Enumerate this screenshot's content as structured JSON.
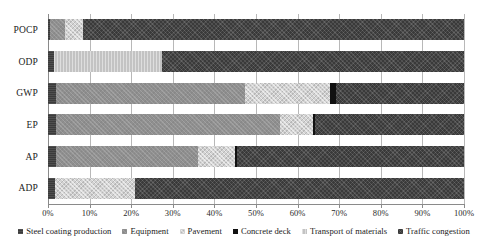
{
  "chart_data": {
    "type": "bar",
    "orientation": "horizontal",
    "stacked": true,
    "normalized": true,
    "title": "",
    "xlabel": "",
    "ylabel": "",
    "xlim": [
      0,
      100
    ],
    "xtick_labels": [
      "0%",
      "10%",
      "20%",
      "30%",
      "40%",
      "50%",
      "60%",
      "70%",
      "80%",
      "90%",
      "100%"
    ],
    "xtick_values": [
      0,
      10,
      20,
      30,
      40,
      50,
      60,
      70,
      80,
      90,
      100
    ],
    "grid": "vertical",
    "legend_position": "bottom",
    "categories": [
      "POCP",
      "ODP",
      "GWP",
      "EP",
      "AP",
      "ADP"
    ],
    "series": [
      {
        "name": "Steel coating production",
        "color": "#3b3b3b",
        "values": [
          0.5,
          1.5,
          2.0,
          2.0,
          2.0,
          1.7
        ]
      },
      {
        "name": "Equipment",
        "color": "#8f8f8f",
        "values": [
          3.6,
          0.0,
          45.4,
          53.8,
          34.0,
          0.0
        ]
      },
      {
        "name": "Pavement",
        "color": "#d2d2d2",
        "values": [
          4.3,
          0.0,
          20.4,
          7.9,
          9.0,
          19.2
        ]
      },
      {
        "name": "Concrete deck",
        "color": "#111111",
        "values": [
          0.0,
          0.0,
          1.4,
          0.6,
          0.5,
          0.0
        ]
      },
      {
        "name": "Transport of materials",
        "color": "#c3c3c3",
        "values": [
          0.0,
          25.9,
          0.0,
          0.0,
          0.0,
          0.0
        ]
      },
      {
        "name": "Traffic congestion",
        "color": "#3a3a3a",
        "values": [
          91.6,
          72.6,
          30.8,
          35.7,
          54.5,
          79.1
        ]
      }
    ]
  }
}
